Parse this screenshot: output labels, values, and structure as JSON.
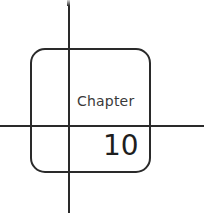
{
  "diagram": {
    "label": "Chapter",
    "number": "10",
    "stroke_color": "#2a2a2a"
  }
}
